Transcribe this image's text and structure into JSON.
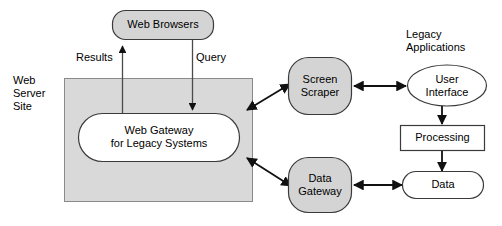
{
  "diagram": {
    "colors": {
      "shape_fill_gray": "#d4d4d4",
      "container_fill_gray": "#d9d9d9",
      "shape_fill_white": "#ffffff",
      "stroke": "#3a3a3a",
      "text": "#000000",
      "background": "#ffffff"
    },
    "groups": {
      "web_server_site": {
        "label": "Web\nServer\nSite"
      },
      "legacy_applications": {
        "label": "Legacy\nApplications"
      }
    },
    "nodes": {
      "web_browsers": {
        "label": "Web Browsers",
        "shape": "rounded-rectangle",
        "fill": "gray"
      },
      "web_gateway": {
        "label": "Web Gateway\nfor Legacy Systems",
        "shape": "stadium",
        "fill": "white"
      },
      "screen_scraper": {
        "label": "Screen\nScraper",
        "shape": "rounded-square",
        "fill": "gray"
      },
      "data_gateway": {
        "label": "Data\nGateway",
        "shape": "rounded-square",
        "fill": "gray"
      },
      "user_interface": {
        "label": "User\nInterface",
        "shape": "ellipse",
        "fill": "white"
      },
      "processing": {
        "label": "Processing",
        "shape": "rectangle",
        "fill": "white"
      },
      "data": {
        "label": "Data",
        "shape": "stadium",
        "fill": "white"
      }
    },
    "edges": {
      "results": {
        "label": "Results",
        "from": "web_gateway",
        "to": "web_browsers",
        "arrow": "single"
      },
      "query": {
        "label": "Query",
        "from": "web_browsers",
        "to": "web_gateway",
        "arrow": "single"
      },
      "gateway_to_scraper": {
        "label": "",
        "from": "web_gateway",
        "to": "screen_scraper",
        "arrow": "double"
      },
      "gateway_to_data_gateway": {
        "label": "",
        "from": "web_gateway",
        "to": "data_gateway",
        "arrow": "double"
      },
      "scraper_to_ui": {
        "label": "",
        "from": "screen_scraper",
        "to": "user_interface",
        "arrow": "double"
      },
      "data_gateway_to_data": {
        "label": "",
        "from": "data_gateway",
        "to": "data",
        "arrow": "double"
      },
      "ui_to_processing": {
        "label": "",
        "from": "user_interface",
        "to": "processing",
        "arrow": "single"
      },
      "processing_to_data": {
        "label": "",
        "from": "processing",
        "to": "data",
        "arrow": "single"
      }
    }
  }
}
